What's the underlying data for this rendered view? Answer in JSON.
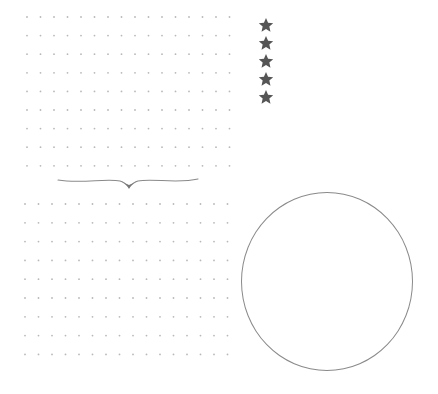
{
  "page": {
    "type": "dot-grid-journal-page",
    "background": "#ffffff"
  },
  "top_grid": {
    "rows": 9,
    "columns": 16,
    "origin_x": 27,
    "origin_y": 17,
    "spacing_x": 13.5,
    "spacing_y": 18.6,
    "dot_color": "#b8b8b8",
    "dot_radius": 0.9
  },
  "bottom_grid": {
    "rows": 9,
    "columns": 16,
    "origin_x": 25,
    "origin_y": 204,
    "spacing_x": 13.5,
    "spacing_y": 18.8,
    "dot_color": "#b8b8b8",
    "dot_radius": 0.9
  },
  "rating": {
    "icon": "star-icon",
    "count": 5,
    "color": "#555555"
  },
  "divider": {
    "icon": "flourish-divider",
    "color": "#777777"
  },
  "circle": {
    "stroke_color": "#8a8a8a",
    "label": ""
  }
}
